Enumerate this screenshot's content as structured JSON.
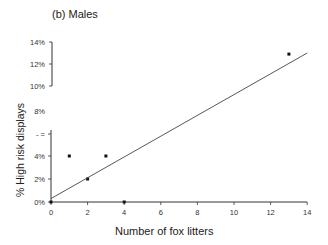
{
  "chart_data": {
    "type": "scatter",
    "title": "(b)  Males",
    "xlabel": "Number of fox litters",
    "ylabel": "% High risk displays",
    "xlim": [
      0,
      14
    ],
    "ylim": [
      0,
      14
    ],
    "x_ticks": [
      "0",
      "2",
      "4",
      "6",
      "8",
      "10",
      "12",
      "14"
    ],
    "y_ticks": [
      "0%",
      "2%",
      "4%",
      "6%",
      "8%",
      "10%",
      "12%",
      "14%"
    ],
    "y_axis_broken": true,
    "grid": false,
    "legend": null,
    "series": [
      {
        "name": "Observed",
        "type": "scatter",
        "x": [
          0,
          1,
          2,
          3,
          4,
          13
        ],
        "y": [
          0,
          4,
          2,
          4,
          0,
          12.9
        ]
      },
      {
        "name": "Regression line",
        "type": "line",
        "x": [
          0,
          14
        ],
        "y": [
          0.3,
          13.0
        ]
      }
    ]
  },
  "labels": {
    "title": "(b)  Males",
    "xlabel": "Number of fox litters",
    "ylabel": "% High risk displays"
  }
}
